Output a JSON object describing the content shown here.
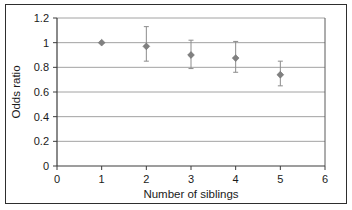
{
  "chart_data": {
    "type": "scatter",
    "title": "",
    "xlabel": "Number of siblings",
    "ylabel": "Odds ratio",
    "xlim": [
      0,
      6
    ],
    "ylim": [
      0,
      1.2
    ],
    "xticks": [
      "0",
      "1",
      "2",
      "3",
      "4",
      "5",
      "6"
    ],
    "yticks": [
      "0",
      "0.2",
      "0.4",
      "0.6",
      "0.8",
      "1",
      "1.2"
    ],
    "xtick_values": [
      0,
      1,
      2,
      3,
      4,
      5,
      6
    ],
    "ytick_values": [
      0,
      0.2,
      0.4,
      0.6,
      0.8,
      1,
      1.2
    ],
    "grid": "horizontal",
    "legend": "none",
    "marker": "diamond",
    "marker_color": "#808080",
    "errorbar_color": "#8c8c8c",
    "gridline_color": "#808080",
    "axis_color": "#4d4d4d",
    "x": [
      1,
      2,
      3,
      4,
      5
    ],
    "values": [
      1.0,
      0.97,
      0.9,
      0.875,
      0.74
    ],
    "error_low": [
      1.0,
      0.85,
      0.79,
      0.76,
      0.65
    ],
    "error_high": [
      1.0,
      1.13,
      1.02,
      1.01,
      0.85
    ],
    "points": [
      {
        "x": 1,
        "y": 1.0,
        "low": 1.0,
        "high": 1.0,
        "has_errorbar": false
      },
      {
        "x": 2,
        "y": 0.97,
        "low": 0.85,
        "high": 1.13,
        "has_errorbar": true
      },
      {
        "x": 3,
        "y": 0.9,
        "low": 0.79,
        "high": 1.02,
        "has_errorbar": true
      },
      {
        "x": 4,
        "y": 0.875,
        "low": 0.76,
        "high": 1.01,
        "has_errorbar": true
      },
      {
        "x": 5,
        "y": 0.74,
        "low": 0.65,
        "high": 0.85,
        "has_errorbar": true
      }
    ]
  },
  "axes": {
    "y_title": "Odds ratio",
    "x_title": "Number of siblings",
    "y_tick_0": "0",
    "y_tick_1": "0.2",
    "y_tick_2": "0.4",
    "y_tick_3": "0.6",
    "y_tick_4": "0.8",
    "y_tick_5": "1",
    "y_tick_6": "1.2",
    "x_tick_0": "0",
    "x_tick_1": "1",
    "x_tick_2": "2",
    "x_tick_3": "3",
    "x_tick_4": "4",
    "x_tick_5": "5",
    "x_tick_6": "6"
  }
}
